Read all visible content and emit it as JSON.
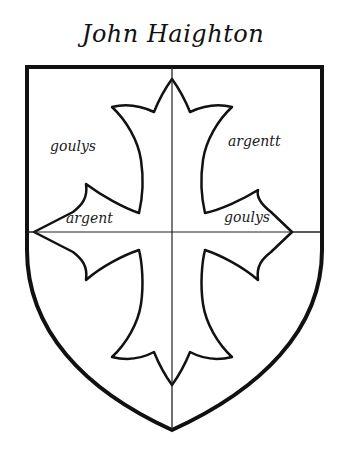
{
  "title": "John Haighton",
  "shield": {
    "outline_color": "#111111",
    "field_color": "#ffffff",
    "charge": "cross patonce"
  },
  "labels": {
    "upper_left": "goulys",
    "upper_right": "argentt",
    "lower_left": "argent",
    "lower_right": "goulys"
  }
}
